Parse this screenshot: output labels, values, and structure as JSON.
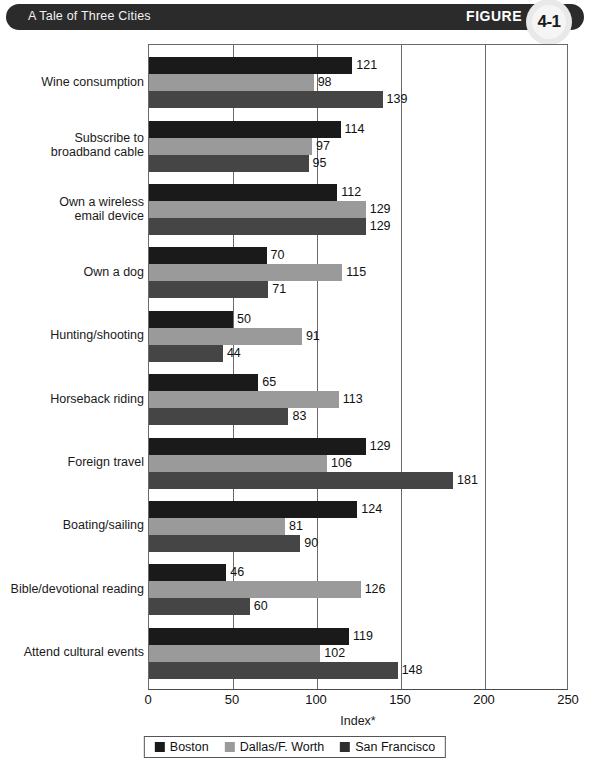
{
  "header": {
    "title": "A Tale of Three Cities",
    "figure_word": "FIGURE",
    "figure_number": "4-1"
  },
  "chart_data": {
    "type": "bar",
    "orientation": "horizontal",
    "title": "A Tale of Three Cities",
    "xlabel": "Index*",
    "ylabel": "",
    "xlim": [
      0,
      250
    ],
    "xticks": [
      0,
      50,
      100,
      150,
      200,
      250
    ],
    "grid": true,
    "legend_position": "bottom",
    "categories": [
      "Wine consumption",
      "Subscribe to broadband cable",
      "Own a wireless email device",
      "Own a dog",
      "Hunting/shooting",
      "Horseback riding",
      "Foreign travel",
      "Boating/sailing",
      "Bible/devotional reading",
      "Attend cultural events"
    ],
    "category_lines": [
      [
        "Wine consumption"
      ],
      [
        "Subscribe to",
        "broadband cable"
      ],
      [
        "Own a wireless",
        "email device"
      ],
      [
        "Own a dog"
      ],
      [
        "Hunting/shooting"
      ],
      [
        "Horseback riding"
      ],
      [
        "Foreign travel"
      ],
      [
        "Boating/sailing"
      ],
      [
        "Bible/devotional reading"
      ],
      [
        "Attend cultural events"
      ]
    ],
    "series": [
      {
        "name": "Boston",
        "color": "#1a1a1a",
        "values": [
          121,
          114,
          112,
          70,
          50,
          65,
          129,
          124,
          46,
          119
        ]
      },
      {
        "name": "Dallas/F. Worth",
        "color": "#9a9a9a",
        "values": [
          98,
          97,
          129,
          115,
          91,
          113,
          106,
          81,
          126,
          102
        ]
      },
      {
        "name": "San Francisco",
        "color": "#454545",
        "values": [
          139,
          95,
          129,
          71,
          44,
          83,
          181,
          90,
          60,
          148
        ]
      }
    ]
  }
}
